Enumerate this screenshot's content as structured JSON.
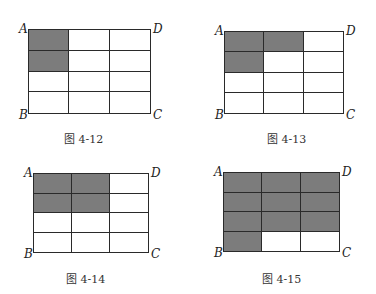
{
  "figures": [
    {
      "caption": "图 4-12",
      "rows": 4,
      "cols": 3,
      "box": {
        "x": 28,
        "y": 29,
        "w": 123,
        "h": 85
      },
      "caption_pos": {
        "x": 64,
        "y": 130
      },
      "corners": {
        "A": "A",
        "B": "B",
        "C": "C",
        "D": "D"
      },
      "shaded": [
        [
          1,
          0,
          0
        ],
        [
          1,
          0,
          0
        ],
        [
          0,
          0,
          0
        ],
        [
          0,
          0,
          0
        ]
      ]
    },
    {
      "caption": "图 4-13",
      "rows": 4,
      "cols": 3,
      "box": {
        "x": 224,
        "y": 31,
        "w": 120,
        "h": 83
      },
      "caption_pos": {
        "x": 267,
        "y": 130
      },
      "corners": {
        "A": "A",
        "B": "B",
        "C": "C",
        "D": "D"
      },
      "shaded": [
        [
          1,
          1,
          0
        ],
        [
          1,
          0,
          0
        ],
        [
          0,
          0,
          0
        ],
        [
          0,
          0,
          0
        ]
      ]
    },
    {
      "caption": "图 4-14",
      "rows": 4,
      "cols": 3,
      "box": {
        "x": 33,
        "y": 173,
        "w": 116,
        "h": 80
      },
      "caption_pos": {
        "x": 66,
        "y": 270
      },
      "corners": {
        "A": "A",
        "B": "B",
        "C": "C",
        "D": "D"
      },
      "shaded": [
        [
          1,
          1,
          0
        ],
        [
          1,
          1,
          0
        ],
        [
          0,
          0,
          0
        ],
        [
          0,
          0,
          0
        ]
      ]
    },
    {
      "caption": "图 4-15",
      "rows": 4,
      "cols": 3,
      "box": {
        "x": 223,
        "y": 172,
        "w": 117,
        "h": 80
      },
      "caption_pos": {
        "x": 262,
        "y": 270
      },
      "corners": {
        "A": "A",
        "B": "B",
        "C": "C",
        "D": "D"
      },
      "shaded": [
        [
          1,
          1,
          1
        ],
        [
          1,
          1,
          1
        ],
        [
          1,
          1,
          1
        ],
        [
          1,
          0,
          0
        ]
      ]
    }
  ],
  "colors": {
    "shade": "#7c7c7c",
    "line": "#2a2a2a"
  }
}
